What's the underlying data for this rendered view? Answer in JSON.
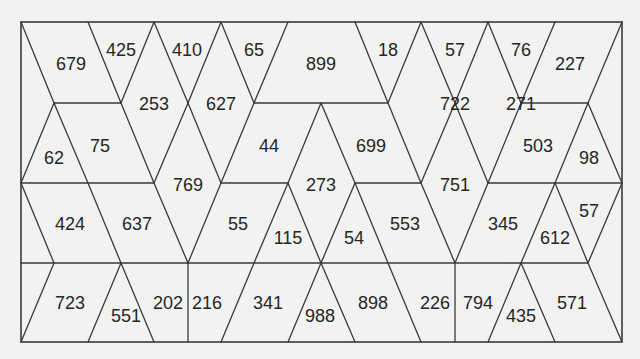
{
  "puzzle": {
    "type": "triangular-grid-number-puzzle",
    "rows": [
      {
        "name": "row-1",
        "cells": [
          "679",
          "425",
          "410",
          "65",
          "899",
          "18",
          "57",
          "76",
          "227"
        ]
      },
      {
        "name": "row-1-2-span",
        "cells": [
          "253",
          "627",
          "722",
          "271"
        ]
      },
      {
        "name": "row-2",
        "cells": [
          "62",
          "75",
          "44",
          "699",
          "503",
          "98"
        ]
      },
      {
        "name": "row-2-3-span",
        "cells": [
          "769",
          "273",
          "751"
        ]
      },
      {
        "name": "row-3",
        "cells": [
          "424",
          "637",
          "55",
          "115",
          "54",
          "553",
          "345",
          "612",
          "57"
        ]
      },
      {
        "name": "row-4",
        "cells": [
          "723",
          "551",
          "202",
          "216",
          "341",
          "988",
          "898",
          "226",
          "794",
          "435",
          "571"
        ]
      }
    ]
  },
  "colors": {
    "background": "#f2f2f0",
    "line": "#3a3a3a",
    "text": "#262626"
  }
}
